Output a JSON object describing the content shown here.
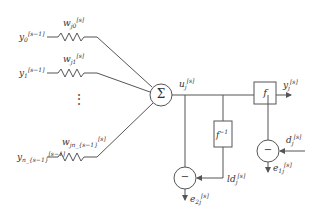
{
  "diagram": {
    "type": "neuron-error-diagram",
    "inputs": [
      {
        "base": "y",
        "sub": "0",
        "sup": "[s−1]",
        "weight_base": "w",
        "weight_sub": "j0",
        "weight_sup": "[s]"
      },
      {
        "base": "y",
        "sub": "1",
        "sup": "[s−1]",
        "weight_base": "w",
        "weight_sub": "j1",
        "weight_sup": "[s]"
      },
      {
        "base": "y",
        "sub": "n_{s−1}",
        "sup": "[s−1]",
        "weight_base": "w",
        "weight_sub": "jn_{s−1}",
        "weight_sup": "[s]"
      }
    ],
    "ellipsis": "⋮",
    "summation_symbol": "Σ",
    "u": {
      "base": "u",
      "sub": "j",
      "sup": "[s]"
    },
    "activation": {
      "label": "f"
    },
    "inverse_activation": {
      "label": "f",
      "sup": "−1"
    },
    "output": {
      "base": "y",
      "sub": "j",
      "sup": "[s]"
    },
    "desired": {
      "base": "d",
      "sub": "j",
      "sup": "[s]"
    },
    "inverse_desired": {
      "base": "ld",
      "sub": "j",
      "sup": "[s]"
    },
    "error1": {
      "base": "e",
      "sub": "1j",
      "sup": "[s]"
    },
    "error2": {
      "base": "e",
      "sub": "2j",
      "sup": "[s]"
    },
    "minus_symbol": "−",
    "colors": {
      "stroke": "#555555",
      "text": "#333333",
      "background": "#ffffff"
    }
  }
}
